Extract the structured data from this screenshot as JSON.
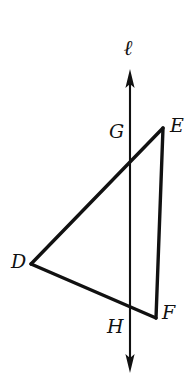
{
  "figure": {
    "type": "geometry-diagram",
    "background_color": "#ffffff",
    "stroke_color": "#111111",
    "labels": {
      "D": "D",
      "E": "E",
      "F": "F",
      "G": "G",
      "H": "H",
      "line": "ℓ"
    },
    "points": {
      "D": {
        "x": 31,
        "y": 264
      },
      "E": {
        "x": 163,
        "y": 128
      },
      "F": {
        "x": 156,
        "y": 318
      },
      "G": {
        "x": 130,
        "y": 162
      },
      "H": {
        "x": 130,
        "y": 310
      }
    },
    "segments": [
      {
        "name": "DE",
        "from": "D",
        "to": "E"
      },
      {
        "name": "EF",
        "from": "E",
        "to": "F"
      },
      {
        "name": "DF",
        "from": "D",
        "to": "F"
      }
    ],
    "line": {
      "name": "ℓ",
      "top": {
        "x": 130,
        "y": 72
      },
      "bottom": {
        "x": 130,
        "y": 372
      },
      "arrow_both_ends": true
    }
  }
}
